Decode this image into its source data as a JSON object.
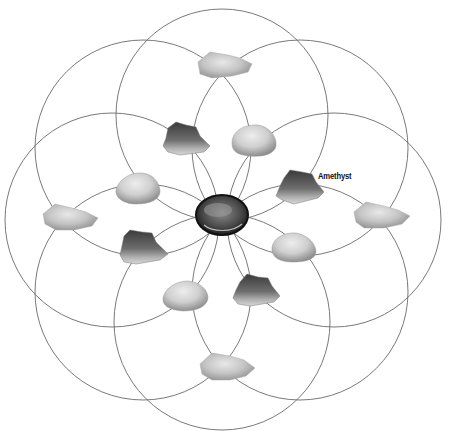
{
  "diagram": {
    "type": "crystal-grid",
    "pattern": "eight overlapping circles around a central stone",
    "colors": {
      "line": "#6a6a6a",
      "background": "#ffffff"
    },
    "center_stone": {
      "name": "center-stone",
      "kind": "dark polished stone",
      "x": 222,
      "y": 215
    },
    "clear_crystals": [
      {
        "x": 225,
        "y": 66
      },
      {
        "x": 70,
        "y": 219
      },
      {
        "x": 381,
        "y": 217
      },
      {
        "x": 228,
        "y": 368
      }
    ],
    "amethyst_clusters": [
      {
        "x": 180,
        "y": 140
      },
      {
        "x": 298,
        "y": 187
      },
      {
        "x": 144,
        "y": 248
      },
      {
        "x": 256,
        "y": 292
      }
    ],
    "tumbled_stones": [
      {
        "x": 254,
        "y": 140
      },
      {
        "x": 138,
        "y": 190
      },
      {
        "x": 294,
        "y": 247
      },
      {
        "x": 186,
        "y": 296
      }
    ],
    "labels": {
      "amethyst": "Amethyst"
    }
  }
}
